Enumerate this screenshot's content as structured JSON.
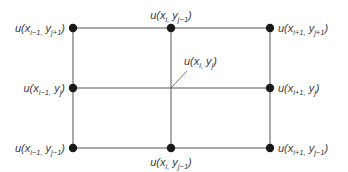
{
  "diagram": {
    "type": "finite-difference-grid",
    "colors": {
      "line": "#555555",
      "node": "#1a1a1a",
      "text": "#3a3a3a",
      "background": "#ffffff"
    },
    "grid": {
      "columns_x": [
        73,
        171,
        270
      ],
      "rows_y": [
        28,
        88,
        148
      ]
    },
    "nodes": [
      {
        "id": "top-left",
        "x": 73,
        "y": 28,
        "label_main": "u(x",
        "sub1": "i−1,",
        "mid": " y",
        "sub2": "j+1",
        "close": ")",
        "label_pos": "left"
      },
      {
        "id": "top-middle",
        "x": 171,
        "y": 28,
        "label_main": "u(x",
        "sub1": "i,",
        "mid": " y",
        "sub2": "j−1",
        "close": ")",
        "label_pos": "above"
      },
      {
        "id": "top-right",
        "x": 270,
        "y": 28,
        "label_main": "u(x",
        "sub1": "i+1,",
        "mid": " y",
        "sub2": "j+1",
        "close": ")",
        "label_pos": "right"
      },
      {
        "id": "middle-left",
        "x": 73,
        "y": 88,
        "label_main": "u(x",
        "sub1": "i−1,",
        "mid": " y",
        "sub2": "j",
        "close": ")",
        "label_pos": "left"
      },
      {
        "id": "middle-right",
        "x": 270,
        "y": 88,
        "label_main": "u(x",
        "sub1": "i+1,",
        "mid": " y",
        "sub2": "j",
        "close": ")",
        "label_pos": "right"
      },
      {
        "id": "bottom-left",
        "x": 73,
        "y": 148,
        "label_main": "u(x",
        "sub1": "i−1,",
        "mid": " y",
        "sub2": "j−1",
        "close": ")",
        "label_pos": "left"
      },
      {
        "id": "bottom-middle",
        "x": 171,
        "y": 148,
        "label_main": "u(x",
        "sub1": "i,",
        "mid": " y",
        "sub2": "j−1",
        "close": ")",
        "label_pos": "below"
      },
      {
        "id": "bottom-right",
        "x": 270,
        "y": 148,
        "label_main": "u(x",
        "sub1": "i+1,",
        "mid": " y",
        "sub2": "j−1",
        "close": ")",
        "label_pos": "right"
      }
    ],
    "center": {
      "x": 171,
      "y": 88,
      "label_main": "u(x",
      "sub1": "i,",
      "mid": " y",
      "sub2": "j",
      "close": ")",
      "leader_to": [
        187,
        71
      ]
    }
  }
}
